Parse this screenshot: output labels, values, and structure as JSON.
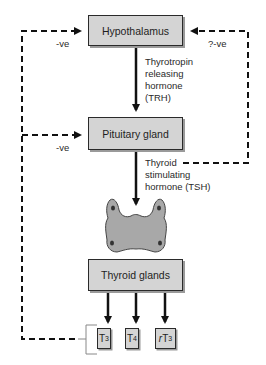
{
  "diagram": {
    "nodes": {
      "hypothalamus": "Hypothalamus",
      "pituitary": "Pituitary gland",
      "thyroid": "Thyroid glands"
    },
    "hormones": {
      "trh": [
        "Thyrotropin",
        "releasing",
        "hormone",
        "(TRH)"
      ],
      "tsh": [
        "Thyroid",
        "stimulating",
        "hormone (TSH)"
      ]
    },
    "products": [
      {
        "prefix": "",
        "base": "T",
        "sub": "3"
      },
      {
        "prefix": "",
        "base": "T",
        "sub": "4"
      },
      {
        "prefix": "r",
        "base": "T",
        "sub": "3"
      }
    ],
    "feedback_labels": {
      "left_hypothalamus": "-ve",
      "left_pituitary": "-ve",
      "right_hypothalamus": "?-ve"
    },
    "colors": {
      "box_fill": "#d4d4d4",
      "box_border": "#2a2a2a",
      "gland_fill": "#a8a8a8",
      "line": "#111111"
    }
  }
}
